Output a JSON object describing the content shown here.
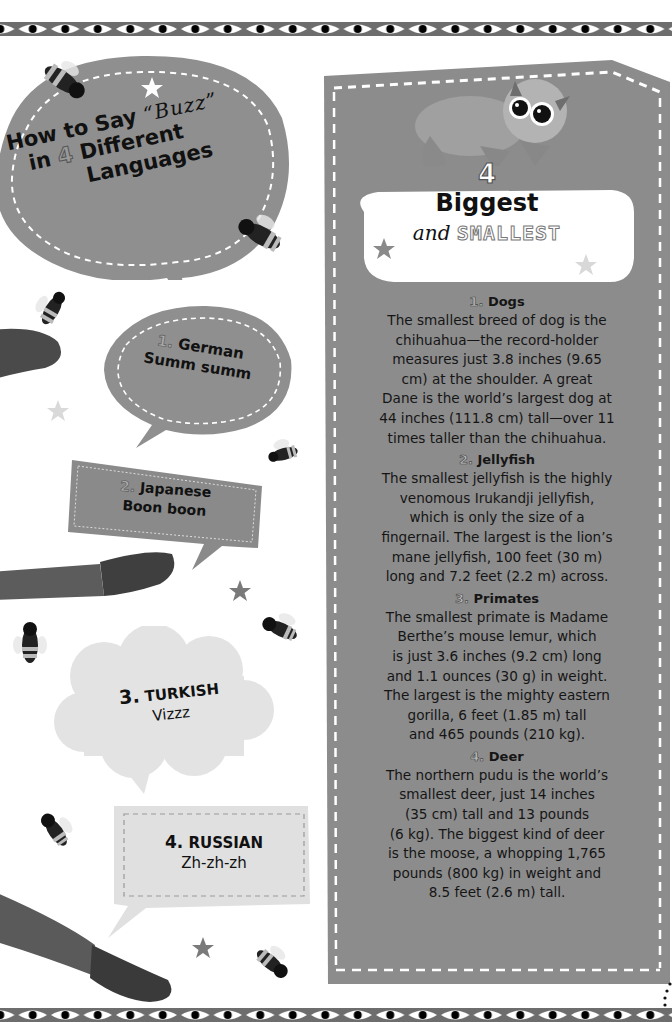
{
  "left": {
    "title": {
      "line1": "How to Say",
      "buzz": "“Buzz”",
      "line2_prefix": "in",
      "number": "4",
      "line2_suffix": "Different",
      "line3": "Languages"
    },
    "languages": [
      {
        "number": "1.",
        "language": "German",
        "sound": "Summ summ"
      },
      {
        "number": "2.",
        "language": "Japanese",
        "sound": "Boon boon"
      },
      {
        "number": "3.",
        "language": "TURKISH",
        "sound": "Vizzz"
      },
      {
        "number": "4.",
        "language": "RUSSIAN",
        "sound": "Zh-zh-zh"
      }
    ]
  },
  "right": {
    "header": {
      "number": "4",
      "title": "Biggest",
      "subtitle_prefix": "and",
      "subtitle_emphasis": "SMALLEST"
    },
    "sections": [
      {
        "number": "1.",
        "title": "Dogs",
        "lines": [
          "The smallest breed of dog is the",
          "chihuahua—the record-holder",
          "measures just 3.8 inches (9.65",
          "cm) at the shoulder. A great",
          "Dane is the world’s largest dog at",
          "44 inches (111.8 cm) tall—over 11",
          "times taller than the chihuahua."
        ]
      },
      {
        "number": "2.",
        "title": "Jellyfish",
        "lines": [
          "The smallest jellyfish is the highly",
          "venomous Irukandji jellyfish,",
          "which is only the size of a",
          "fingernail. The largest is the lion’s",
          "mane jellyfish, 100 feet (30 m)",
          "long and 7.2 feet (2.2 m) across."
        ]
      },
      {
        "number": "3.",
        "title": "Primates",
        "lines": [
          "The smallest primate is Madame",
          "Berthe’s mouse lemur, which",
          "is just 3.6 inches (9.2 cm) long",
          "and 1.1 ounces (30 g) in weight.",
          "The largest is the mighty eastern",
          "gorilla, 6 feet (1.85 m) tall",
          "and 465 pounds (210 kg)."
        ]
      },
      {
        "number": "4.",
        "title": "Deer",
        "lines": [
          "The northern pudu is the world’s",
          "smallest deer, just 14 inches",
          "(35 cm) tall and 13 pounds",
          "(6 kg). The biggest kind of deer",
          "is the moose, a whopping 1,765",
          "pounds (800 kg) in weight and",
          "8.5 feet (2.6 m) tall."
        ]
      }
    ]
  },
  "decorations": {
    "icons": [
      "eye-border-pattern",
      "bee-icon",
      "star-icon",
      "lemur-illustration",
      "tail-illustration"
    ]
  },
  "colors": {
    "panel_gray": "#8c8c8c",
    "bubble_gray": "#8f8f8f",
    "cloud_light": "#e3e3e3",
    "border_dark": "#6d6d6d",
    "text": "#111111"
  }
}
